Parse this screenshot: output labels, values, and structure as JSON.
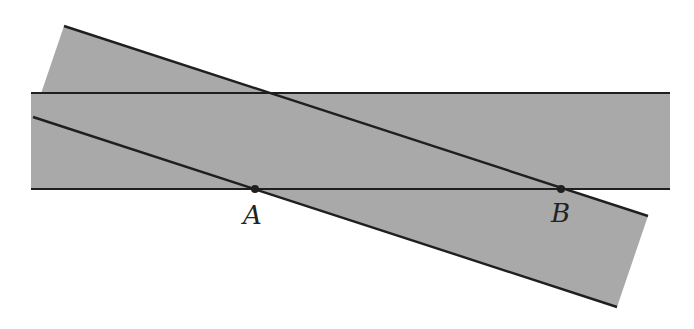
{
  "diagram": {
    "colors": {
      "strip_fill": "#a9a9a9",
      "edge_stroke": "#1f1f1f",
      "point_fill": "#1f1f1f",
      "background": "#ffffff"
    },
    "horizontal_strip": {
      "x_left": 31,
      "x_right": 670,
      "y_top": 93,
      "y_bottom": 189
    },
    "slanted_strip": {
      "upper_edge": {
        "x1": 64,
        "y1": 26,
        "x2": 648,
        "y2": 216
      },
      "lower_edge": {
        "x1": 33,
        "y1": 117,
        "x2": 617,
        "y2": 307
      },
      "corners": [
        [
          64,
          26
        ],
        [
          648,
          216
        ],
        [
          617,
          307
        ],
        [
          33,
          117
        ]
      ]
    },
    "points": [
      {
        "name": "A",
        "label": "A",
        "x": 255,
        "y": 189,
        "label_x": 243,
        "label_y": 224
      },
      {
        "name": "B",
        "label": "B",
        "x": 561,
        "y": 189,
        "label_x": 551,
        "label_y": 222
      }
    ]
  }
}
